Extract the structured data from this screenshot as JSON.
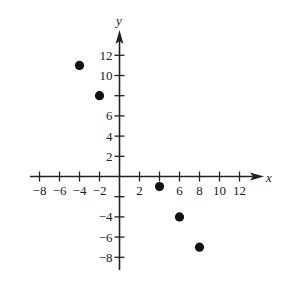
{
  "chart_data": {
    "type": "scatter",
    "title": "",
    "xlabel": "x",
    "ylabel": "y",
    "xlim": [
      -9,
      14
    ],
    "ylim": [
      -9,
      14.5
    ],
    "grid": false,
    "legend": null,
    "x_ticks": [
      -8,
      -6,
      -4,
      -2,
      2,
      4,
      6,
      8,
      10,
      12
    ],
    "x_tick_labels": [
      "−8",
      "−6",
      "−4",
      "−2",
      "2",
      "",
      "6",
      "8",
      "10",
      "12"
    ],
    "y_ticks": [
      12,
      10,
      8,
      6,
      4,
      2,
      -2,
      -4,
      -6,
      -8
    ],
    "y_tick_labels": [
      "12",
      "10",
      "",
      "6",
      "4",
      "2",
      "",
      "−4",
      "−6",
      "−8"
    ],
    "series": [
      {
        "name": "points",
        "marker": "filled-circle",
        "color": "#111111",
        "points": [
          {
            "x": -4,
            "y": 11
          },
          {
            "x": -2,
            "y": 8
          },
          {
            "x": 4,
            "y": -1
          },
          {
            "x": 6,
            "y": -4
          },
          {
            "x": 8,
            "y": -7
          }
        ]
      }
    ]
  },
  "style": {
    "axis_color": "#222222",
    "point_color": "#111111",
    "background": "#ffffff"
  }
}
